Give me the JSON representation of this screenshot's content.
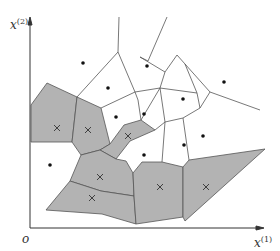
{
  "figure": {
    "axes": {
      "x_label_base": "x",
      "x_label_sup": "(1)",
      "y_label_base": "x",
      "y_label_sup": "(2)",
      "origin_label": "o"
    },
    "colors": {
      "shaded_cell": "#b3b3b3",
      "cell_edge": "#555555",
      "axis": "#333333",
      "dot": "#111111",
      "cross": "#333333"
    },
    "legend_markers": {
      "class_dot": "filled dot (white cells)",
      "class_cross": "cross × (shaded cells)"
    },
    "points_dot": [
      [
        83,
        63
      ],
      [
        147,
        66
      ],
      [
        224,
        82
      ],
      [
        108,
        88
      ],
      [
        183,
        99
      ],
      [
        116,
        117
      ],
      [
        144,
        114
      ],
      [
        203,
        136
      ],
      [
        184,
        145
      ],
      [
        144,
        155
      ],
      [
        50,
        165
      ]
    ],
    "points_cross": [
      [
        57,
        128
      ],
      [
        88,
        130
      ],
      [
        128,
        136
      ],
      [
        100,
        177
      ],
      [
        92,
        198
      ],
      [
        160,
        187
      ],
      [
        206,
        187
      ]
    ]
  }
}
